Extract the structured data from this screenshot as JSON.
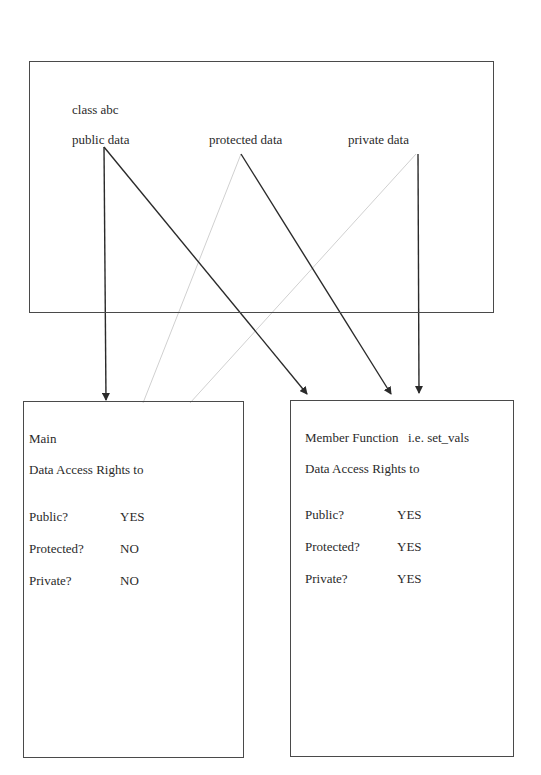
{
  "class_box": {
    "title": "class abc",
    "members": [
      {
        "label": "public data",
        "access": "public"
      },
      {
        "label": "protected data",
        "access": "protected"
      },
      {
        "label": "private data",
        "access": "private"
      }
    ]
  },
  "main_box": {
    "title": "Main",
    "subtitle": "Data Access Rights to",
    "rows": [
      {
        "label": "Public?",
        "value": "YES"
      },
      {
        "label": "Protected?",
        "value": "NO"
      },
      {
        "label": "Private?",
        "value": "NO"
      }
    ]
  },
  "member_box": {
    "title": "Member Function",
    "example": "i.e. set_vals",
    "subtitle": "Data Access Rights to",
    "rows": [
      {
        "label": "Public?",
        "value": "YES"
      },
      {
        "label": "Protected?",
        "value": "YES"
      },
      {
        "label": "Private?",
        "value": "YES"
      }
    ]
  },
  "connections": [
    {
      "from": "public data",
      "to": "Main",
      "style": "arrow",
      "color": "#2a2a2a"
    },
    {
      "from": "public data",
      "to": "Member Function",
      "style": "arrow",
      "color": "#2a2a2a"
    },
    {
      "from": "protected data",
      "to": "Member Function",
      "style": "arrow",
      "color": "#2a2a2a"
    },
    {
      "from": "private data",
      "to": "Member Function",
      "style": "arrow",
      "color": "#2a2a2a"
    },
    {
      "from": "protected data",
      "to": "Main",
      "style": "blocked-faint-line",
      "color": "#d0d0d0"
    },
    {
      "from": "private data",
      "to": "Main",
      "style": "blocked-faint-line",
      "color": "#d0d0d0"
    }
  ]
}
